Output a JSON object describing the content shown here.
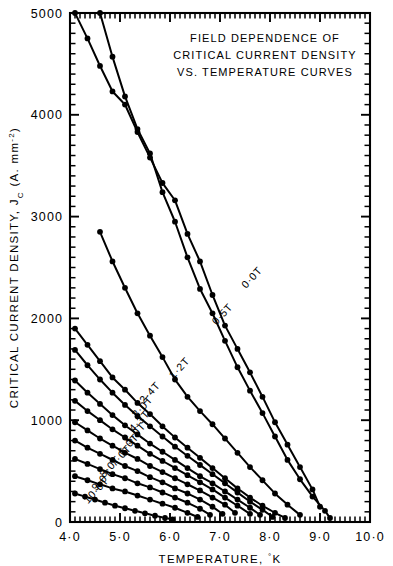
{
  "figure": {
    "title_lines": [
      "FIELD DEPENDENCE OF",
      "CRITICAL CURRENT DENSITY",
      "VS. TEMPERATURE CURVES"
    ]
  },
  "chart_data": {
    "type": "line",
    "xlabel": "TEMPERATURE, °K",
    "ylabel": "CRITICAL CURRENT DENSITY, Jc (A. mm⁻²)",
    "ylabel_parts": {
      "main": "CRITICAL  CURRENT  DENSITY,",
      "symbol": "J",
      "subscript": "C",
      "units": "(A. mm",
      "units_exp": "-2",
      "units_close": ")"
    },
    "xlim": [
      4.0,
      10.0
    ],
    "ylim": [
      0,
      5000
    ],
    "xticks": [
      4.0,
      5.0,
      6.0,
      7.0,
      8.0,
      9.0,
      10.0
    ],
    "xticklabels": [
      "4·0",
      "5·0",
      "6·0",
      "7·0",
      "8·0",
      "9·0",
      "10·0"
    ],
    "yticks": [
      0,
      1000,
      2000,
      3000,
      4000,
      5000
    ],
    "yticklabels": [
      "0",
      "1000",
      "2000",
      "3000",
      "4000",
      "5000"
    ],
    "x_minor_step": 0.1,
    "y_minor_step": 100,
    "grid": false,
    "legend": "inline-curve-labels",
    "marker": "filled-circle",
    "series": [
      {
        "name": "0·0T",
        "label": "0·0T",
        "label_x": 7.52,
        "label_y": 2290,
        "x": [
          4.6,
          4.85,
          5.1,
          5.35,
          5.6,
          5.85,
          6.1,
          6.35,
          6.6,
          6.85,
          7.1,
          7.35,
          7.6,
          7.85,
          8.1,
          8.35,
          8.6,
          8.85,
          9.1,
          9.2
        ],
        "y": [
          5000,
          4570,
          4180,
          3860,
          3620,
          3240,
          2950,
          2600,
          2290,
          2050,
          1780,
          1520,
          1290,
          1070,
          840,
          610,
          420,
          250,
          110,
          40
        ]
      },
      {
        "name": "0·5T",
        "label": "0·5T",
        "label_x": 6.93,
        "label_y": 1930,
        "x": [
          4.1,
          4.35,
          4.6,
          4.85,
          5.1,
          5.35,
          5.6,
          5.85,
          6.1,
          6.35,
          6.6,
          6.85,
          7.1,
          7.35,
          7.6,
          7.85,
          8.1,
          8.35,
          8.6,
          8.85,
          9.0
        ],
        "y": [
          5000,
          4750,
          4480,
          4230,
          4100,
          3830,
          3580,
          3330,
          3160,
          2830,
          2560,
          2230,
          1930,
          1700,
          1470,
          1230,
          980,
          760,
          540,
          320,
          150
        ]
      },
      {
        "name": "1·2T",
        "label": "1·2T",
        "label_x": 6.07,
        "label_y": 1400,
        "x": [
          4.6,
          4.85,
          5.1,
          5.35,
          5.6,
          5.85,
          6.1,
          6.35,
          6.6,
          6.85,
          7.1,
          7.35,
          7.6,
          7.85,
          8.1,
          8.35,
          8.6
        ],
        "y": [
          2850,
          2560,
          2300,
          2050,
          1830,
          1620,
          1400,
          1230,
          1090,
          960,
          820,
          680,
          540,
          410,
          280,
          170,
          70
        ]
      },
      {
        "name": "2·4T",
        "label": "2·4T",
        "label_x": 5.48,
        "label_y": 1160,
        "x": [
          4.1,
          4.35,
          4.6,
          4.85,
          5.1,
          5.35,
          5.6,
          5.85,
          6.1,
          6.35,
          6.6,
          6.85,
          7.1,
          7.35,
          7.6,
          7.85,
          8.1,
          8.3
        ],
        "y": [
          1900,
          1740,
          1580,
          1420,
          1300,
          1170,
          1060,
          940,
          830,
          730,
          630,
          530,
          430,
          330,
          240,
          160,
          90,
          40
        ]
      },
      {
        "name": "3·0T",
        "label": "3·0T",
        "label_x": 5.33,
        "label_y": 1020,
        "x": [
          4.1,
          4.35,
          4.6,
          4.85,
          5.1,
          5.35,
          5.6,
          5.85,
          6.1,
          6.35,
          6.6,
          6.85,
          7.1,
          7.35,
          7.6,
          7.85,
          8.05
        ],
        "y": [
          1690,
          1540,
          1400,
          1270,
          1150,
          1040,
          940,
          840,
          740,
          650,
          560,
          470,
          380,
          290,
          200,
          120,
          50
        ]
      },
      {
        "name": "4·3T",
        "label": "4·3T",
        "label_x": 5.27,
        "label_y": 880,
        "x": [
          4.1,
          4.35,
          4.6,
          4.85,
          5.1,
          5.35,
          5.6,
          5.85,
          6.1,
          6.35,
          6.6,
          6.85,
          7.1,
          7.35,
          7.6,
          7.8
        ],
        "y": [
          1390,
          1270,
          1160,
          1050,
          950,
          860,
          770,
          690,
          610,
          530,
          450,
          380,
          300,
          220,
          140,
          70
        ]
      },
      {
        "name": "5·0T",
        "label": "5·0T",
        "label_x": 5.19,
        "label_y": 760,
        "x": [
          4.1,
          4.35,
          4.6,
          4.85,
          5.1,
          5.35,
          5.6,
          5.85,
          6.1,
          6.35,
          6.6,
          6.85,
          7.1,
          7.35,
          7.6
        ],
        "y": [
          1190,
          1090,
          1000,
          910,
          830,
          750,
          670,
          600,
          530,
          460,
          390,
          320,
          240,
          160,
          80
        ]
      },
      {
        "name": "6·0T",
        "label": "6·0T",
        "label_x": 5.05,
        "label_y": 650,
        "x": [
          4.1,
          4.35,
          4.6,
          4.85,
          5.1,
          5.35,
          5.6,
          5.85,
          6.1,
          6.35,
          6.6,
          6.85,
          7.1,
          7.3
        ],
        "y": [
          980,
          900,
          820,
          750,
          680,
          620,
          550,
          490,
          430,
          370,
          310,
          240,
          170,
          90
        ]
      },
      {
        "name": "7·0T",
        "label": "7·0T",
        "label_x": 4.9,
        "label_y": 540,
        "x": [
          4.1,
          4.35,
          4.6,
          4.85,
          5.1,
          5.35,
          5.6,
          5.85,
          6.1,
          6.35,
          6.6,
          6.85,
          7.05
        ],
        "y": [
          800,
          730,
          670,
          610,
          550,
          500,
          440,
          390,
          330,
          280,
          220,
          150,
          80
        ]
      },
      {
        "name": "8·0T",
        "label": "8·0T",
        "label_x": 4.68,
        "label_y": 430,
        "x": [
          4.1,
          4.35,
          4.6,
          4.85,
          5.1,
          5.35,
          5.6,
          5.85,
          6.1,
          6.35,
          6.6,
          6.8
        ],
        "y": [
          620,
          570,
          520,
          470,
          430,
          380,
          340,
          290,
          240,
          190,
          130,
          70
        ]
      },
      {
        "name": "9·0T",
        "label": "9·0T",
        "label_x": 4.52,
        "label_y": 300,
        "x": [
          4.1,
          4.35,
          4.6,
          4.85,
          5.1,
          5.35,
          5.6,
          5.85,
          6.1,
          6.35,
          6.55
        ],
        "y": [
          450,
          410,
          370,
          330,
          300,
          260,
          220,
          180,
          140,
          90,
          50
        ]
      },
      {
        "name": "10·0T",
        "label": "10·0T",
        "label_x": 4.36,
        "label_y": 175,
        "x": [
          4.1,
          4.3,
          4.5,
          4.7,
          4.9,
          5.1,
          5.3,
          5.5,
          5.7,
          5.9,
          6.05
        ],
        "y": [
          280,
          250,
          220,
          190,
          160,
          135,
          110,
          85,
          62,
          40,
          25
        ]
      }
    ]
  }
}
